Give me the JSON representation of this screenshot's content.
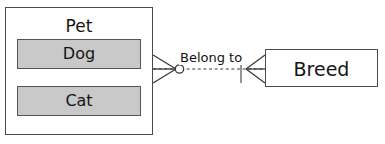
{
  "diagram": {
    "type": "entity-relationship-diagram",
    "notation": "crow's foot",
    "background_color": "#ffffff",
    "entities": [
      {
        "id": "pet",
        "title": "Pet",
        "border_color": "#4a4a4a",
        "fill_color": "#ffffff",
        "attributes": [
          {
            "id": "dog",
            "label": "Dog",
            "fill_color": "#c9c9c9",
            "border_color": "#555555"
          },
          {
            "id": "cat",
            "label": "Cat",
            "fill_color": "#c9c9c9",
            "border_color": "#555555"
          }
        ]
      },
      {
        "id": "breed",
        "title": "Breed",
        "border_color": "#4a4a4a",
        "fill_color": "#ffffff",
        "attributes": []
      }
    ],
    "relationship": {
      "label": "Belong to",
      "from": "Pet",
      "to": "Breed",
      "line_style": "dashed",
      "line_color": "#3a3a3a",
      "from_cardinality": "zero-or-many",
      "to_cardinality": "one-or-many",
      "from_symbol": "crows-foot-circle",
      "to_symbol": "crows-foot-bar"
    }
  }
}
